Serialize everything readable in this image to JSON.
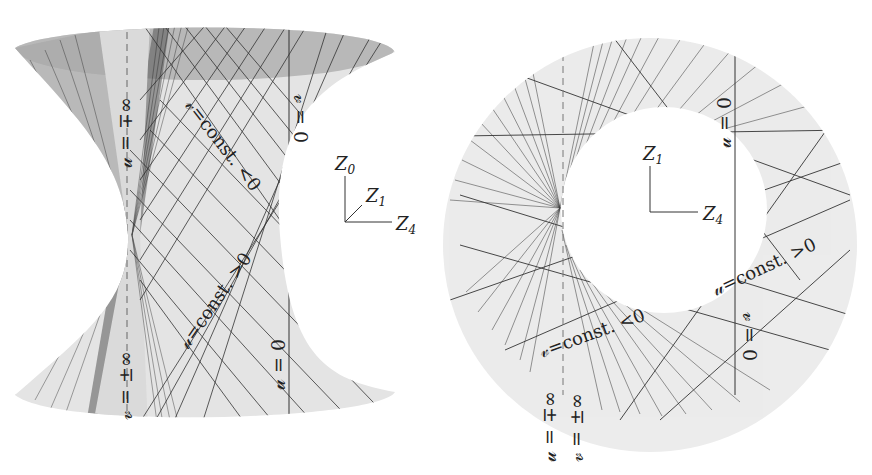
{
  "left_panel": {
    "description": "Hyperboloid of one sheet with two families of rulings",
    "labels": {
      "u_inf": "𝓊 = ∓∞",
      "v_inf": "𝓋 = ±∞",
      "v_const_neg": "𝓋=const. <0",
      "u_const_pos": "𝓊=const. >0",
      "v_zero": "𝓋 = 0",
      "u_zero": "𝓊 = 0"
    },
    "axes": {
      "up": "Z",
      "up_sub": "0",
      "diag": "Z",
      "diag_sub": "1",
      "right": "Z",
      "right_sub": "4"
    }
  },
  "right_panel": {
    "description": "Top-down projection: annulus with tangent ruling lines",
    "labels": {
      "u_zero": "𝓊 = 0",
      "u_const_pos": "𝓊=const. >0",
      "v_const_neg": "𝓋=const. <0",
      "v_zero": "𝓋 = 0",
      "u_inf": "𝓊 = ∓∞",
      "v_inf": "𝓋 = ±∞"
    },
    "axes": {
      "up": "Z",
      "up_sub": "1",
      "right": "Z",
      "right_sub": "4"
    }
  },
  "colors": {
    "surface_light": "#e6e6e6",
    "surface_dark": "#b4b4b4",
    "line": "#333333",
    "shade": "#8c8c8c"
  }
}
